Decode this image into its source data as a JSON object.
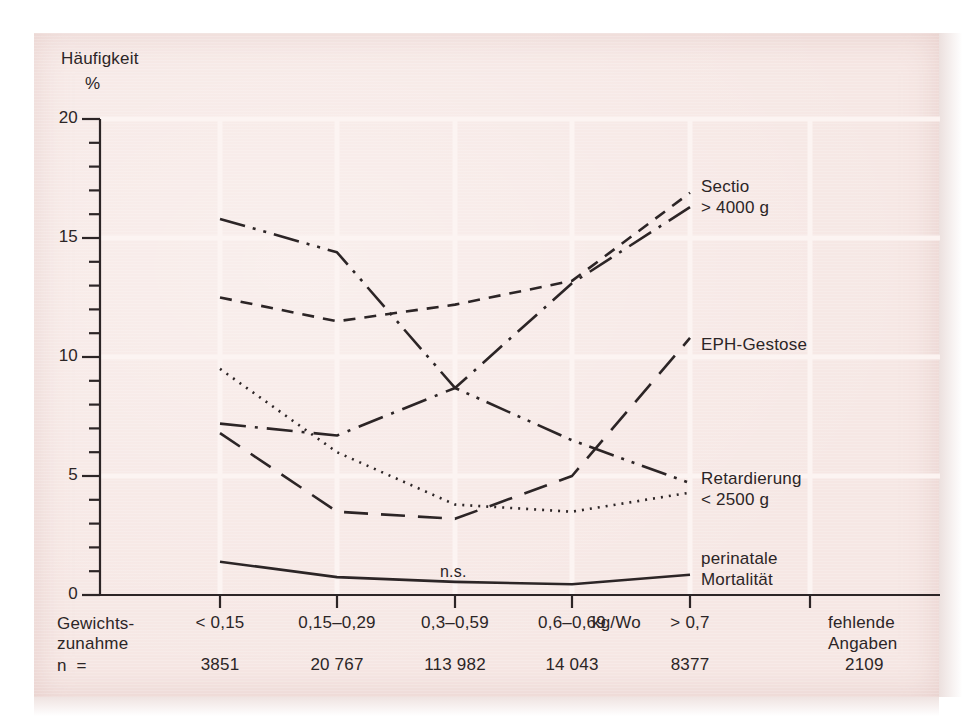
{
  "figure": {
    "background_color": "#f6e7e4",
    "ink_color": "#2c2526",
    "gridline_color": "#fdf5f3"
  },
  "axes": {
    "y_axis_title_line1": "Häufigkeit",
    "y_axis_title_line2": "%",
    "y_ticks": [
      "20",
      "15",
      "10",
      "5",
      "0"
    ],
    "y_min": 0,
    "y_max": 20,
    "y_major_step": 5,
    "y_minor_step": 1,
    "row_label_weight_line1": "Gewichts-",
    "row_label_weight_line2": "zunahme",
    "row_label_n": "n  =",
    "x_unit": "kg/Wo",
    "missing_line1": "fehlende",
    "missing_line2": "Angaben",
    "missing_n": "2109"
  },
  "categories": [
    {
      "label": "< 0,15",
      "n": "3851"
    },
    {
      "label": "0,15–0,29",
      "n": "20 767"
    },
    {
      "label": "0,3–0,59",
      "n": "113 982"
    },
    {
      "label": "0,6–0,69",
      "n": "14 043"
    },
    {
      "label": "> 0,7",
      "n": "8377"
    }
  ],
  "annotations": [
    {
      "name": "not-significant",
      "text": "n.s."
    }
  ],
  "series_labels": [
    {
      "line1": "Sectio",
      "line2": "> 4000 g"
    },
    {
      "line1": "EPH-Gestose",
      "line2": ""
    },
    {
      "line1": "Retardierung",
      "line2": "< 2500 g"
    },
    {
      "line1": "perinatale",
      "line2": "Mortalität"
    }
  ],
  "chart_data": {
    "type": "line",
    "title": "",
    "xlabel": "Gewichtszunahme (kg/Wo)",
    "ylabel": "Häufigkeit %",
    "ylim": [
      0,
      20
    ],
    "grid": true,
    "legend": "right-inline",
    "categories": [
      "< 0,15",
      "0,15–0,29",
      "0,3–0,59",
      "0,6–0,69",
      "> 0,7"
    ],
    "n_values": [
      "3851",
      "20 767",
      "113 982",
      "14 043",
      "8377"
    ],
    "series": [
      {
        "name": "Sectio > 4000 g",
        "style": "short-dashed",
        "values": [
          12.5,
          11.5,
          12.2,
          13.2,
          16.9
        ]
      },
      {
        "name": "EPH-Gestose",
        "style": "dash-dot",
        "values": [
          7.2,
          6.7,
          8.7,
          13.1,
          16.3
        ]
      },
      {
        "name": "Retardierung < 2500 g (Frühgeburt-Trend)",
        "style": "dash-dot-dot",
        "values": [
          15.8,
          14.4,
          8.7,
          6.5,
          4.7
        ]
      },
      {
        "name": "Retardierung < 2500 g",
        "style": "dotted",
        "values": [
          9.5,
          6.0,
          3.8,
          3.5,
          4.3
        ]
      },
      {
        "name": "Mangelgeburt (lang gestrichelt)",
        "style": "long-dashed",
        "values": [
          6.8,
          3.5,
          3.2,
          5.0,
          10.8
        ]
      },
      {
        "name": "perinatale Mortalität",
        "style": "solid",
        "values": [
          1.4,
          0.75,
          0.55,
          0.45,
          0.85
        ]
      }
    ]
  }
}
